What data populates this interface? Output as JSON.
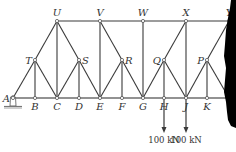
{
  "diagram": {
    "type": "truss",
    "nodes": {
      "A": {
        "x": 13,
        "y": 98,
        "label": "A",
        "label_pos": "left"
      },
      "B": {
        "x": 35,
        "y": 98,
        "label": "B",
        "label_pos": "below"
      },
      "C": {
        "x": 57,
        "y": 98,
        "label": "C",
        "label_pos": "below"
      },
      "D": {
        "x": 79,
        "y": 98,
        "label": "D",
        "label_pos": "below"
      },
      "E": {
        "x": 100,
        "y": 98,
        "label": "E",
        "label_pos": "below"
      },
      "F": {
        "x": 122,
        "y": 98,
        "label": "F",
        "label_pos": "below"
      },
      "G": {
        "x": 143,
        "y": 98,
        "label": "G",
        "label_pos": "below"
      },
      "H": {
        "x": 164,
        "y": 98,
        "label": "H",
        "label_pos": "below"
      },
      "J": {
        "x": 186,
        "y": 98,
        "label": "J",
        "label_pos": "below"
      },
      "K": {
        "x": 207,
        "y": 98,
        "label": "K",
        "label_pos": "below"
      },
      "L": {
        "x": 229,
        "y": 98,
        "label": "",
        "label_pos": "none"
      },
      "T": {
        "x": 35,
        "y": 60,
        "label": "T",
        "label_pos": "left"
      },
      "S": {
        "x": 79,
        "y": 60,
        "label": "S",
        "label_pos": "right"
      },
      "R": {
        "x": 122,
        "y": 60,
        "label": "R",
        "label_pos": "right"
      },
      "Q": {
        "x": 164,
        "y": 60,
        "label": "Q",
        "label_pos": "left"
      },
      "P": {
        "x": 207,
        "y": 60,
        "label": "P",
        "label_pos": "left"
      },
      "U": {
        "x": 57,
        "y": 21,
        "label": "U",
        "label_pos": "above"
      },
      "V": {
        "x": 100,
        "y": 21,
        "label": "V",
        "label_pos": "above"
      },
      "W": {
        "x": 143,
        "y": 21,
        "label": "W",
        "label_pos": "above"
      },
      "X": {
        "x": 186,
        "y": 21,
        "label": "X",
        "label_pos": "above"
      },
      "Y": {
        "x": 229,
        "y": 21,
        "label": "Y",
        "label_pos": "above"
      }
    },
    "members": [
      [
        "A",
        "B"
      ],
      [
        "B",
        "C"
      ],
      [
        "C",
        "D"
      ],
      [
        "D",
        "E"
      ],
      [
        "E",
        "F"
      ],
      [
        "F",
        "G"
      ],
      [
        "G",
        "H"
      ],
      [
        "H",
        "J"
      ],
      [
        "J",
        "K"
      ],
      [
        "K",
        "L"
      ],
      [
        "U",
        "V"
      ],
      [
        "V",
        "W"
      ],
      [
        "W",
        "X"
      ],
      [
        "X",
        "Y"
      ],
      [
        "A",
        "T"
      ],
      [
        "T",
        "U"
      ],
      [
        "T",
        "B"
      ],
      [
        "T",
        "C"
      ],
      [
        "U",
        "C"
      ],
      [
        "U",
        "S"
      ],
      [
        "S",
        "C"
      ],
      [
        "S",
        "D"
      ],
      [
        "S",
        "E"
      ],
      [
        "V",
        "E"
      ],
      [
        "V",
        "R"
      ],
      [
        "R",
        "E"
      ],
      [
        "R",
        "F"
      ],
      [
        "R",
        "G"
      ],
      [
        "W",
        "G"
      ],
      [
        "G",
        "Q"
      ],
      [
        "Q",
        "X"
      ],
      [
        "Q",
        "H"
      ],
      [
        "Q",
        "J"
      ],
      [
        "X",
        "J"
      ],
      [
        "J",
        "P"
      ],
      [
        "P",
        "Y"
      ],
      [
        "P",
        "K"
      ],
      [
        "P",
        "L"
      ]
    ],
    "loads": [
      {
        "node": "H",
        "label": "100 kN",
        "length": 35
      },
      {
        "node": "J",
        "label": "100 kN",
        "length": 35
      }
    ],
    "support": {
      "node": "A",
      "type": "pin"
    },
    "colors": {
      "member": "#3a3a3a",
      "text": "#333333",
      "torn_edge": "#000000"
    }
  }
}
